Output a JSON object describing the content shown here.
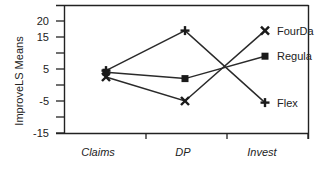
{
  "chart_data": {
    "type": "line",
    "title": "",
    "xlabel": "",
    "ylabel": "ImproveLS Means",
    "categories": [
      "Claims",
      "DP",
      "Invest"
    ],
    "yticks": [
      20,
      15,
      10,
      5,
      0,
      -5,
      -10,
      -15
    ],
    "ytick_labels": [
      "20",
      "15",
      "",
      "5",
      "",
      "-5",
      "",
      "-15"
    ],
    "ylim": [
      -15,
      25
    ],
    "grid": false,
    "legend_position": "inline-right",
    "series": [
      {
        "name": "FourDay",
        "label_visible": "FourDa",
        "marker": "x",
        "values": [
          2.5,
          -5,
          17
        ]
      },
      {
        "name": "Regular",
        "label_visible": "Regula",
        "marker": "square",
        "values": [
          4,
          2,
          9
        ]
      },
      {
        "name": "Flex",
        "label_visible": "Flex",
        "marker": "plus",
        "values": [
          4.5,
          17,
          -5.5
        ]
      }
    ]
  }
}
